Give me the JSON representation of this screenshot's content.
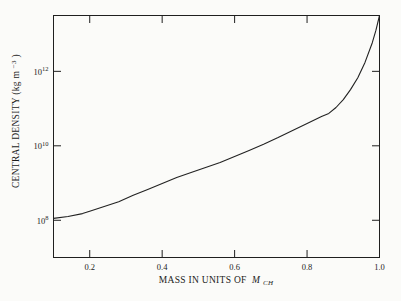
{
  "figure": {
    "background": "#fbfbf9",
    "axis_color": "#1f1f1f",
    "curve_color": "#222222",
    "text_color": "#1b1b1b"
  },
  "chart_data": {
    "type": "line",
    "title": "",
    "xlabel": {
      "prefix": "MASS IN UNITS OF ",
      "symbol": "M",
      "subscript": "CH"
    },
    "ylabel": {
      "prefix": "CENTRAL DENSITY (kg m",
      "exponent": "−3",
      "suffix": ")"
    },
    "x_axis": {
      "scale": "linear",
      "min": 0.1,
      "max": 1.0,
      "ticks": [
        {
          "value": 0.2,
          "label": "0.2"
        },
        {
          "value": 0.4,
          "label": "0.4"
        },
        {
          "value": 0.6,
          "label": "0.6"
        },
        {
          "value": 0.8,
          "label": "0.8"
        },
        {
          "value": 1.0,
          "label": "1.0"
        }
      ]
    },
    "y_axis": {
      "scale": "log",
      "log_min": 7.0,
      "log_max": 13.5,
      "ticks": [
        {
          "log_value": 8,
          "base": "10",
          "exponent": "8"
        },
        {
          "log_value": 10,
          "base": "10",
          "exponent": "10"
        },
        {
          "log_value": 12,
          "base": "10",
          "exponent": "12"
        }
      ]
    },
    "series": [
      {
        "name": "central-density-vs-mass",
        "points_mass_logdensity": [
          [
            0.1,
            8.05
          ],
          [
            0.14,
            8.1
          ],
          [
            0.18,
            8.18
          ],
          [
            0.2,
            8.24
          ],
          [
            0.24,
            8.37
          ],
          [
            0.28,
            8.5
          ],
          [
            0.32,
            8.67
          ],
          [
            0.36,
            8.83
          ],
          [
            0.4,
            8.99
          ],
          [
            0.44,
            9.15
          ],
          [
            0.48,
            9.28
          ],
          [
            0.52,
            9.42
          ],
          [
            0.56,
            9.55
          ],
          [
            0.6,
            9.71
          ],
          [
            0.64,
            9.87
          ],
          [
            0.68,
            10.04
          ],
          [
            0.72,
            10.22
          ],
          [
            0.76,
            10.41
          ],
          [
            0.8,
            10.6
          ],
          [
            0.84,
            10.79
          ],
          [
            0.86,
            10.87
          ],
          [
            0.88,
            11.03
          ],
          [
            0.9,
            11.24
          ],
          [
            0.92,
            11.51
          ],
          [
            0.94,
            11.83
          ],
          [
            0.96,
            12.24
          ],
          [
            0.98,
            12.77
          ],
          [
            0.99,
            13.1
          ],
          [
            1.0,
            13.5
          ]
        ]
      }
    ]
  }
}
